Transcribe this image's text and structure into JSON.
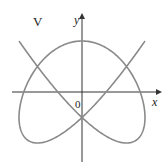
{
  "figure": {
    "label": "V",
    "x_axis_label": "x",
    "y_axis_label": "y",
    "origin_label": "0",
    "curve": {
      "type": "parametric",
      "description": "Lissajous-type closed curve",
      "color": "#8a8a8a",
      "x_amplitude_px": 63,
      "y_amplitude_px": 51,
      "x_freq": 3,
      "y_freq": 4,
      "phase": 0.3927
    },
    "axis_color": "#333333"
  }
}
